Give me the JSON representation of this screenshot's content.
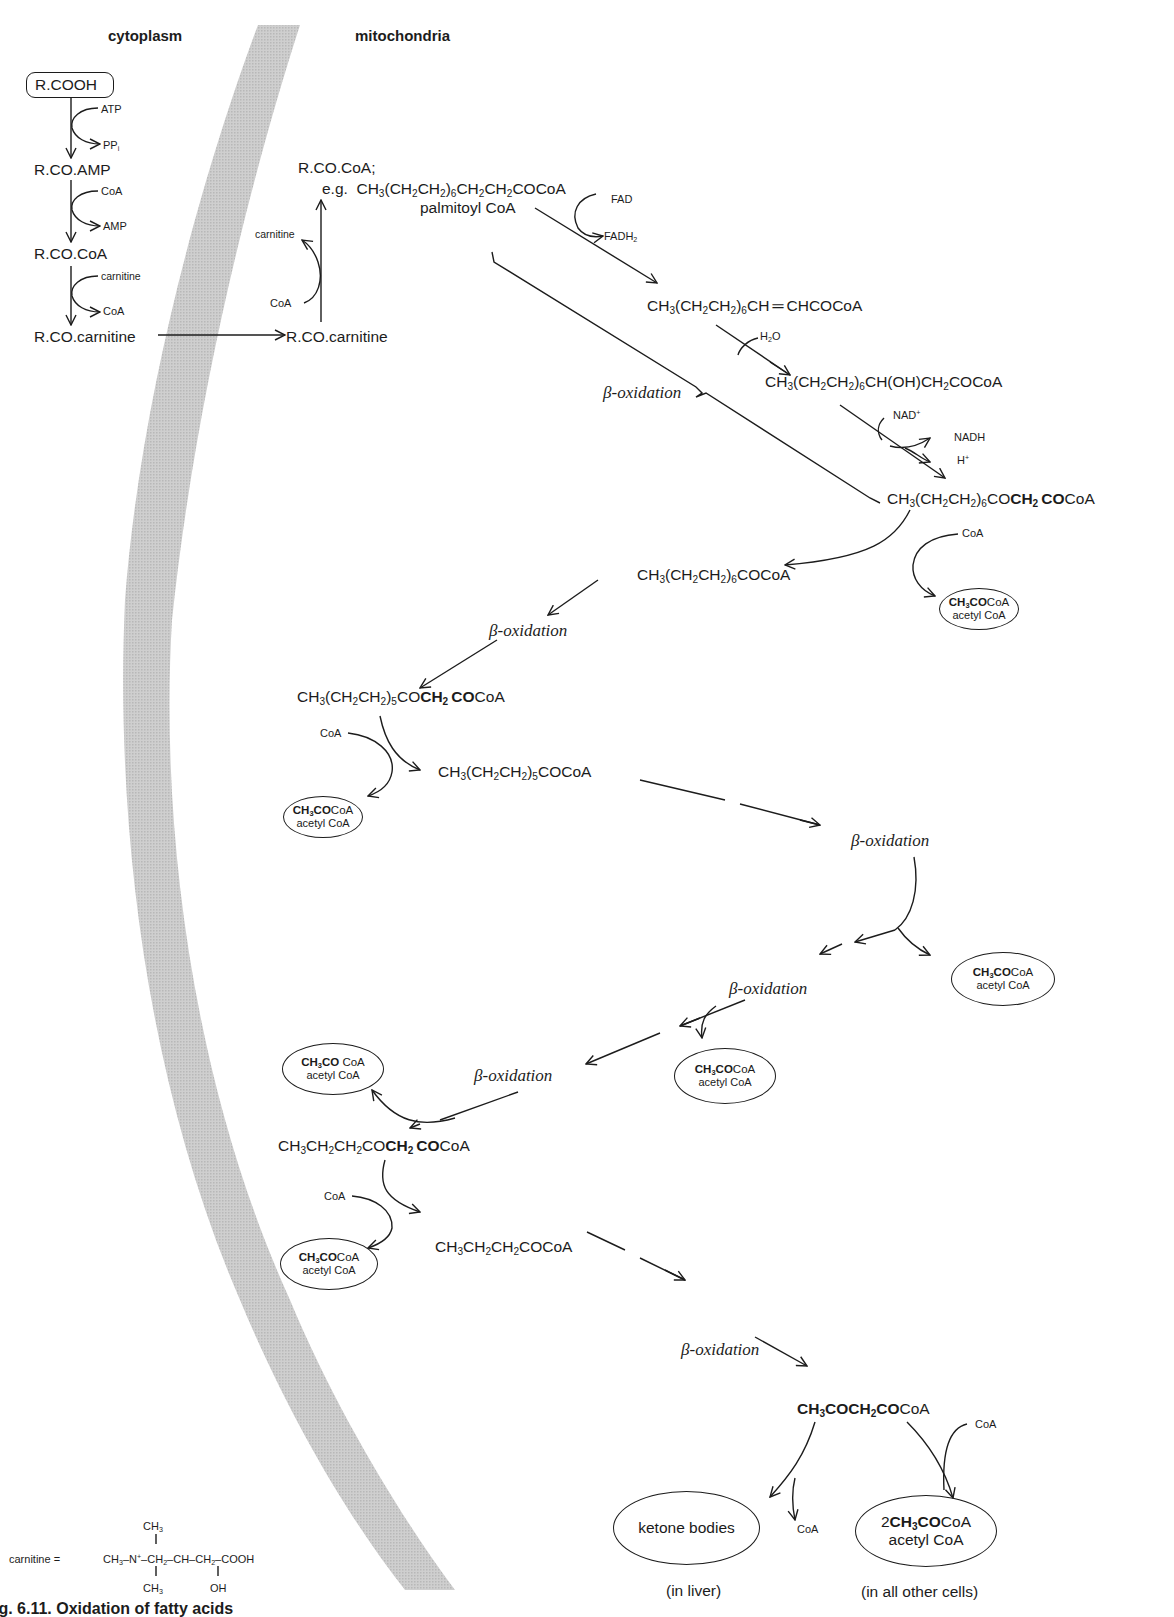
{
  "headers": {
    "cytoplasm": "cytoplasm",
    "mitochondria": "mitochondria"
  },
  "colors": {
    "membrane": "#c4c4c4",
    "ink": "#1c1c1c",
    "background": "#ffffff"
  },
  "cytoplasm_steps": {
    "start": "R.COOH",
    "step1_in": "ATP",
    "step1_out_main": "PP",
    "step1_out_sub": "i",
    "product1": "R.CO.AMP",
    "step2_in": "CoA",
    "step2_out": "AMP",
    "product2": "R.CO.CoA",
    "step3_in": "carnitine",
    "step3_out": "CoA",
    "product3": "R.CO.carnitine"
  },
  "transport": {
    "mito_carnitine_ester": "R.CO.carnitine",
    "cofactor_in": "CoA",
    "cofactor_out": "carnitine"
  },
  "palmitoyl": {
    "generic": "R.CO.CoA;",
    "example_prefix": "e.g.",
    "formula": "CH3(CH2CH2)6CH2CH2COCoA",
    "name": "palmitoyl CoA"
  },
  "beta_cycle": {
    "dehydrogenation_in": "FAD",
    "dehydrogenation_out": "FADH2",
    "enoyl": "CH3(CH2CH2)6CH=CHCOCoA",
    "hydration_in": "H2O",
    "hydroxyacyl": "CH3(CH2CH2)6CH(OH)CH2COCoA",
    "oxidation_in": "NAD+",
    "oxidation_out1": "NADH",
    "oxidation_out2": "H+",
    "ketoacyl": "CH3(CH2CH2)6COCH2COCoA",
    "bracket_label": "β-oxidation",
    "thiolysis_in": "CoA"
  },
  "chain": [
    {
      "id": "c14",
      "formula": "CH3(CH2CH2)6COCoA"
    },
    {
      "id": "c14_keto",
      "formula": "CH3(CH2CH2)5COCH2COCoA"
    },
    {
      "id": "c12",
      "formula": "CH3(CH2CH2)5COCoA"
    },
    {
      "id": "c6_keto",
      "formula": "CH3CH2CH2COCH2COCoA"
    },
    {
      "id": "c4",
      "formula": "CH3CH2CH2COCoA"
    },
    {
      "id": "acetoacetyl",
      "formula": "CH3COCH2COCoA"
    }
  ],
  "beta_labels": [
    "β-oxidation",
    "β-oxidation",
    "β-oxidation",
    "β-oxidation",
    "β-oxidation",
    "β-oxidation"
  ],
  "acetyl_coa": {
    "formula_bold": "CH3CO",
    "formula_rest": "CoA",
    "name": "acetyl CoA",
    "count_visible": 7
  },
  "coa_labels": [
    "CoA",
    "CoA",
    "CoA",
    "CoA",
    "CoA"
  ],
  "outcomes": {
    "ketone": "ketone bodies",
    "ketone_where": "(in liver)",
    "ketone_coa": "CoA",
    "acetyl_final_prefix": "2",
    "acetyl_final_bold": "CH3CO",
    "acetyl_final_rest": "CoA",
    "acetyl_final_name": "acetyl CoA",
    "acetyl_where": "(in all other cells)",
    "acetyl_final_coa": "CoA"
  },
  "carnitine_structure": {
    "label": "carnitine =",
    "top_methyl": "CH3",
    "main_chain": "CH3–N+–CH2–CH–CH2–COOH",
    "bottom_methyl": "CH3",
    "hydroxyl": "OH"
  },
  "caption": "ig. 6.11. Oxidation of fatty acids"
}
